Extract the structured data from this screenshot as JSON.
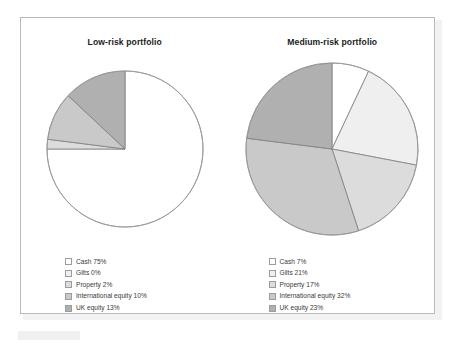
{
  "colors": {
    "cash": "#ffffff",
    "gilts": "#efefef",
    "property": "#dcdcdc",
    "international_equity": "#c9c9c9",
    "uk_equity": "#b0b0b0",
    "slice_stroke": "#7d7d7d",
    "frame_border": "#b9b9b9",
    "title_text": "#1c1c1c",
    "legend_text": "#3a3a3a"
  },
  "chart_data": [
    {
      "type": "pie",
      "title": "Low-risk portfolio",
      "legend_position": "below",
      "start_angle": 0,
      "direction": "clockwise",
      "categories": [
        "Cash",
        "Gilts",
        "Property",
        "International equity",
        "UK equity"
      ],
      "values": [
        75,
        0,
        2,
        10,
        13
      ],
      "unit": "%",
      "labels": [
        "Cash 75%",
        "Gilts 0%",
        "Property 2%",
        "International equity 10%",
        "UK equity 13%"
      ],
      "colors": [
        "#ffffff",
        "#efefef",
        "#dcdcdc",
        "#c9c9c9",
        "#b0b0b0"
      ]
    },
    {
      "type": "pie",
      "title": "Medium-risk portfolio",
      "legend_position": "below",
      "start_angle": 0,
      "direction": "clockwise",
      "categories": [
        "Cash",
        "Gilts",
        "Property",
        "International equity",
        "UK equity"
      ],
      "values": [
        7,
        21,
        17,
        32,
        23
      ],
      "unit": "%",
      "labels": [
        "Cash 7%",
        "Gilts 21%",
        "Property 17%",
        "International equity 32%",
        "UK equity 23%"
      ],
      "colors": [
        "#ffffff",
        "#efefef",
        "#dcdcdc",
        "#c9c9c9",
        "#b0b0b0"
      ]
    }
  ]
}
